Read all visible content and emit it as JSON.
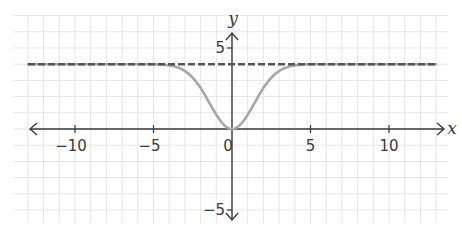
{
  "chart_data": {
    "type": "line",
    "title": "",
    "xlabel": "x",
    "ylabel": "y",
    "xlim": [
      -13.8,
      13.0
    ],
    "ylim": [
      -6.2,
      7.0
    ],
    "grid": true,
    "legend": null,
    "x_ticks": [
      -10,
      -5,
      5,
      10
    ],
    "x_tick_labels": [
      "−10",
      "−5",
      "5",
      "10"
    ],
    "y_ticks": [
      5,
      -5
    ],
    "y_tick_labels": [
      "5",
      "−5"
    ],
    "origin_label": "0",
    "series": [
      {
        "name": "y = 4(1 − e^(−x²/4))",
        "style": "solid",
        "color": "#a6a6a6",
        "x": [
          -13,
          -10,
          -8,
          -6,
          -5,
          -4,
          -3.5,
          -3,
          -2.5,
          -2,
          -1.5,
          -1,
          -0.5,
          0,
          0.5,
          1,
          1.5,
          2,
          2.5,
          3,
          3.5,
          4,
          5,
          6,
          8,
          10,
          13
        ],
        "y": [
          4.0,
          4.0,
          4.0,
          4.0,
          3.99,
          3.93,
          3.81,
          3.58,
          3.18,
          2.53,
          1.72,
          0.88,
          0.25,
          0.0,
          0.25,
          0.88,
          1.72,
          2.53,
          3.18,
          3.58,
          3.81,
          3.93,
          3.99,
          4.0,
          4.0,
          4.0,
          4.0
        ]
      },
      {
        "name": "asymptote y = 4",
        "style": "dashed",
        "color": "#555555",
        "x": [
          -13,
          13
        ],
        "y": [
          4,
          4
        ]
      }
    ],
    "annotations": []
  },
  "colors": {
    "grid": "#e6e6e6",
    "axis": "#3a3a3a",
    "curve": "#a6a6a6",
    "asymptote": "#555555"
  }
}
